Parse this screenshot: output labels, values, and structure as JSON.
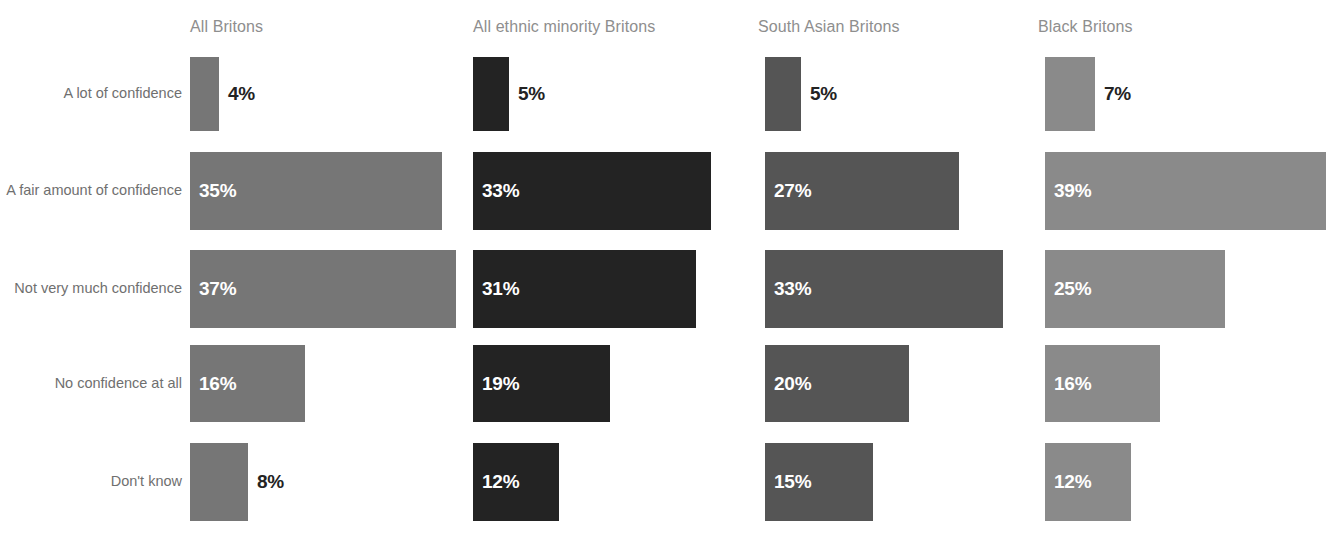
{
  "chart_data": {
    "type": "bar",
    "title": "",
    "subtitle": "",
    "xlabel": "",
    "ylabel": "",
    "orientation": "horizontal",
    "grid": false,
    "legend_position": "none",
    "value_suffix": "%",
    "categories": [
      "A lot of confidence",
      "A fair amount of confidence",
      "Not very much confidence",
      "No confidence at all",
      "Don't know"
    ],
    "series": [
      {
        "name": "All Britons",
        "color": "#767676",
        "values": [
          4,
          35,
          37,
          16,
          8
        ]
      },
      {
        "name": "All ethnic minority Britons",
        "color": "#232323",
        "values": [
          5,
          33,
          31,
          19,
          12
        ]
      },
      {
        "name": "South Asian Britons",
        "color": "#555555",
        "values": [
          5,
          27,
          33,
          20,
          15
        ]
      },
      {
        "name": "Black Britons",
        "color": "#8a8a8a",
        "values": [
          7,
          39,
          25,
          16,
          12
        ]
      }
    ],
    "value_labels": [
      [
        "4%",
        "35%",
        "37%",
        "16%",
        "8%"
      ],
      [
        "5%",
        "33%",
        "31%",
        "19%",
        "12%"
      ],
      [
        "5%",
        "27%",
        "33%",
        "20%",
        "15%"
      ],
      [
        "7%",
        "39%",
        "25%",
        "16%",
        "12%"
      ]
    ],
    "xlim": [
      0,
      40
    ]
  },
  "layout": {
    "columns": [
      {
        "label": "All Britons",
        "left": 190,
        "header_left": 190
      },
      {
        "label": "All ethnic minority Britons",
        "left": 473,
        "header_left": 473
      },
      {
        "label": "South Asian Britons",
        "left": 765,
        "header_left": 758
      },
      {
        "label": "Black Britons",
        "left": 1045,
        "header_left": 1038
      }
    ],
    "rows": [
      {
        "label": "A lot of confidence",
        "top": 57,
        "height": 74
      },
      {
        "label": "A fair amount of confidence",
        "top": 152,
        "height": 78
      },
      {
        "label": "Not very much confidence",
        "top": 250,
        "height": 78
      },
      {
        "label": "No confidence at all",
        "top": 345,
        "height": 77
      },
      {
        "label": "Don't know",
        "top": 443,
        "height": 78
      }
    ],
    "px_per_percent": 7.2,
    "min_bar_width_px": 28
  },
  "colors": {
    "background": "#ffffff",
    "header_text": "#8e8e8e",
    "row_label_text": "#6f6f6f",
    "value_text_inside": "#ffffff",
    "value_text_outside": "#232323"
  }
}
